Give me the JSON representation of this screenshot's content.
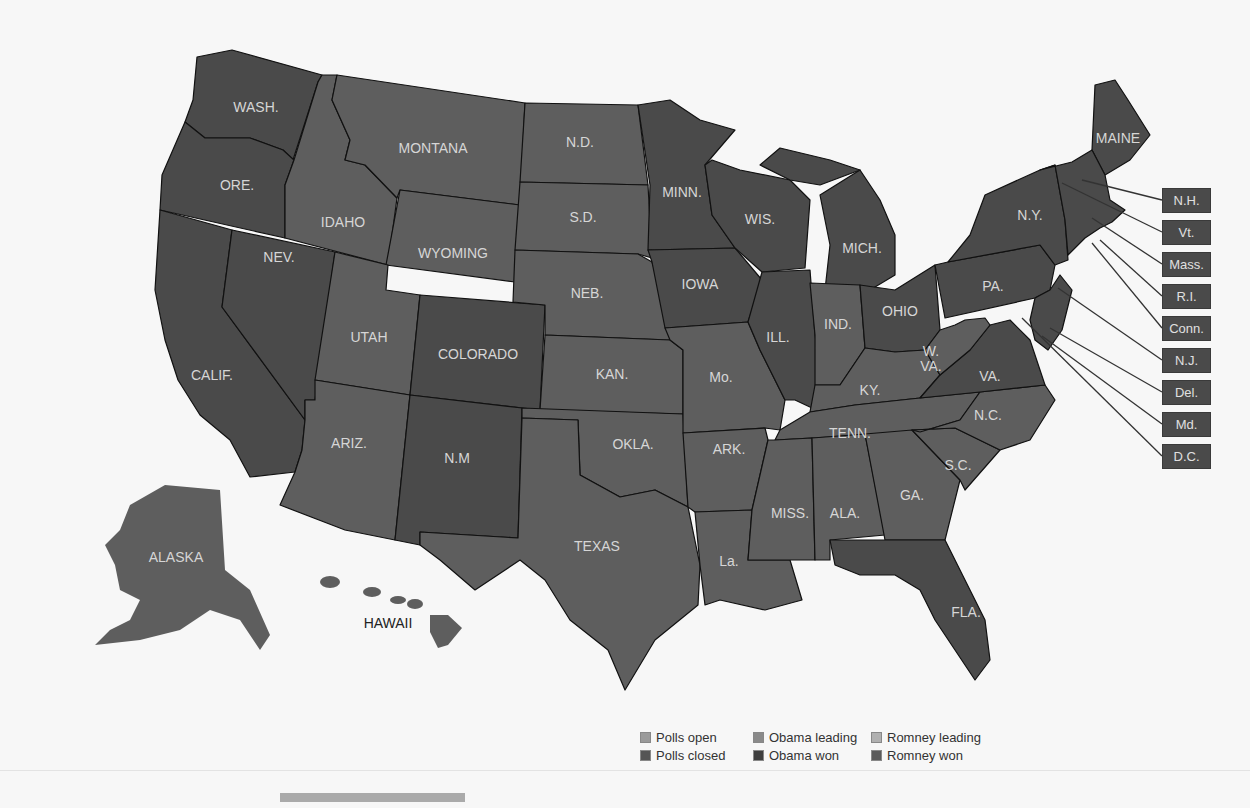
{
  "map": {
    "title_hidden": "",
    "colors": {
      "obama_won": "#4a4a4a",
      "romney_won": "#5e5e5e",
      "polls_open": "#9a9a9a",
      "polls_closed": "#555555",
      "obama_leading": "#8a8a8a",
      "romney_leading": "#b0b0b0"
    },
    "states": [
      {
        "label": "WASH.",
        "result": "obama"
      },
      {
        "label": "ORE.",
        "result": "obama"
      },
      {
        "label": "CALIF.",
        "result": "obama"
      },
      {
        "label": "NEV.",
        "result": "obama"
      },
      {
        "label": "IDAHO",
        "result": "romney"
      },
      {
        "label": "MONTANA",
        "result": "romney"
      },
      {
        "label": "WYOMING",
        "result": "romney"
      },
      {
        "label": "UTAH",
        "result": "romney"
      },
      {
        "label": "ARIZ.",
        "result": "romney"
      },
      {
        "label": "COLORADO",
        "result": "obama"
      },
      {
        "label": "N.M",
        "result": "obama"
      },
      {
        "label": "N.D.",
        "result": "romney"
      },
      {
        "label": "S.D.",
        "result": "romney"
      },
      {
        "label": "NEB.",
        "result": "romney"
      },
      {
        "label": "KAN.",
        "result": "romney"
      },
      {
        "label": "OKLA.",
        "result": "romney"
      },
      {
        "label": "TEXAS",
        "result": "romney"
      },
      {
        "label": "MINN.",
        "result": "obama"
      },
      {
        "label": "IOWA",
        "result": "obama"
      },
      {
        "label": "Mo.",
        "result": "romney"
      },
      {
        "label": "ARK.",
        "result": "romney"
      },
      {
        "label": "La.",
        "result": "romney"
      },
      {
        "label": "WIS.",
        "result": "obama"
      },
      {
        "label": "ILL.",
        "result": "obama"
      },
      {
        "label": "MICH.",
        "result": "obama"
      },
      {
        "label": "IND.",
        "result": "romney"
      },
      {
        "label": "OHIO",
        "result": "obama"
      },
      {
        "label": "KY.",
        "result": "romney"
      },
      {
        "label": "TENN.",
        "result": "romney"
      },
      {
        "label": "MISS.",
        "result": "romney"
      },
      {
        "label": "ALA.",
        "result": "romney"
      },
      {
        "label": "GA.",
        "result": "romney"
      },
      {
        "label": "FLA.",
        "result": "obama"
      },
      {
        "label": "S.C.",
        "result": "romney"
      },
      {
        "label": "N.C.",
        "result": "romney"
      },
      {
        "label": "VA.",
        "result": "obama"
      },
      {
        "label": "W. VA.",
        "result": "romney"
      },
      {
        "label": "PA.",
        "result": "obama"
      },
      {
        "label": "N.Y.",
        "result": "obama"
      },
      {
        "label": "MAINE",
        "result": "obama"
      },
      {
        "label": "ALASKA",
        "result": "romney"
      },
      {
        "label": "HAWAII",
        "result": "obama"
      }
    ],
    "labels": {
      "wash": "WASH.",
      "ore": "ORE.",
      "calif": "CALIF.",
      "nev": "NEV.",
      "idaho": "IDAHO",
      "montana": "MONTANA",
      "wyoming": "WYOMING",
      "utah": "UTAH",
      "ariz": "ARIZ.",
      "colorado": "COLORADO",
      "nm": "N.M",
      "nd": "N.D.",
      "sd": "S.D.",
      "neb": "NEB.",
      "kan": "KAN.",
      "okla": "OKLA.",
      "texas": "TEXAS",
      "minn": "MINN.",
      "iowa": "IOWA",
      "mo": "Mo.",
      "ark": "ARK.",
      "la": "La.",
      "wis": "WIS.",
      "ill": "ILL.",
      "mich": "MICH.",
      "ind": "IND.",
      "ohio": "OHIO",
      "ky": "KY.",
      "tenn": "TENN.",
      "miss": "MISS.",
      "ala": "ALA.",
      "ga": "GA.",
      "fla": "FLA.",
      "sc": "S.C.",
      "nc": "N.C.",
      "va": "VA.",
      "wva1": "W.",
      "wva2": "VA.",
      "pa": "PA.",
      "ny": "N.Y.",
      "maine": "MAINE",
      "alaska": "ALASKA",
      "hawaii": "HAWAII"
    },
    "callouts": [
      {
        "label": "N.H.",
        "result": "obama"
      },
      {
        "label": "Vt.",
        "result": "obama"
      },
      {
        "label": "Mass.",
        "result": "obama"
      },
      {
        "label": "R.I.",
        "result": "obama"
      },
      {
        "label": "Conn.",
        "result": "obama"
      },
      {
        "label": "N.J.",
        "result": "obama"
      },
      {
        "label": "Del.",
        "result": "obama"
      },
      {
        "label": "Md.",
        "result": "obama"
      },
      {
        "label": "D.C.",
        "result": "obama"
      }
    ]
  },
  "legend": {
    "items": [
      {
        "label": "Polls open",
        "color": "#9a9a9a"
      },
      {
        "label": "Obama leading",
        "color": "#8a8a8a"
      },
      {
        "label": "Romney leading",
        "color": "#b0b0b0"
      },
      {
        "label": "Polls closed",
        "color": "#555555"
      },
      {
        "label": "Obama won",
        "color": "#3f3f3f"
      },
      {
        "label": "Romney won",
        "color": "#5a5a5a"
      }
    ]
  }
}
